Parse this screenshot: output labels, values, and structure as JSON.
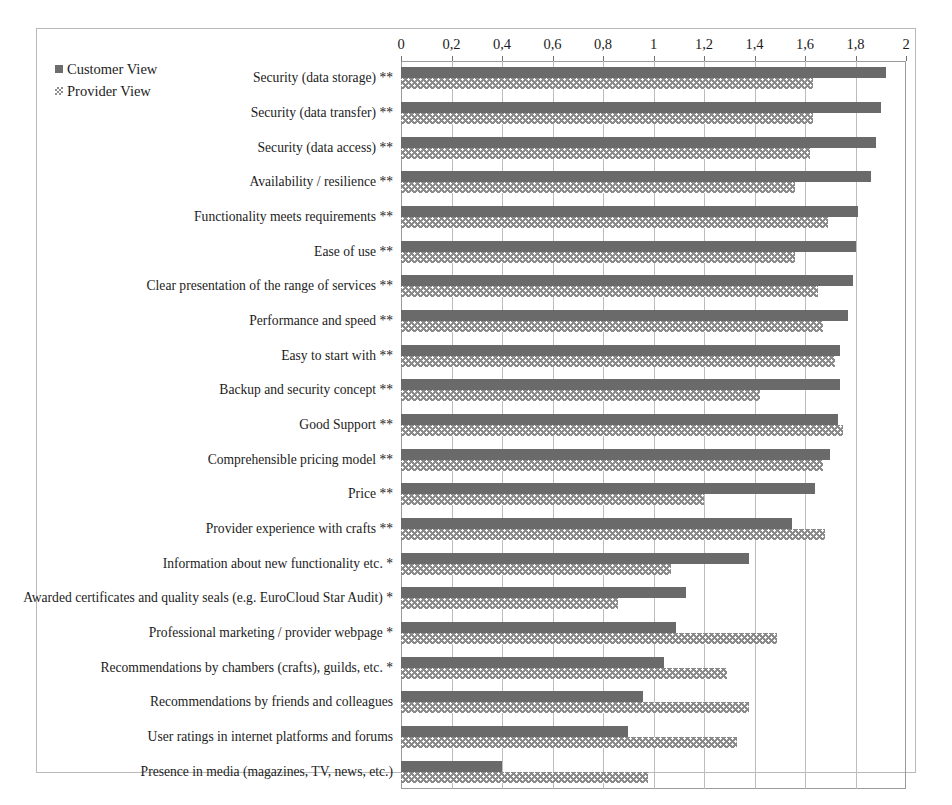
{
  "chart_data": {
    "type": "bar",
    "orientation": "horizontal",
    "title": "",
    "xlabel": "",
    "ylabel": "",
    "xlim": [
      0,
      2
    ],
    "xticks": [
      0,
      0.2,
      0.4,
      0.6,
      0.8,
      1,
      1.2,
      1.4,
      1.6,
      1.8,
      2
    ],
    "xtick_labels": [
      "0",
      "0,2",
      "0,4",
      "0,6",
      "0,8",
      "1",
      "1,2",
      "1,4",
      "1,6",
      "1,8",
      "2"
    ],
    "decimal_separator": ",",
    "grid": true,
    "legend_position": "top-left",
    "legend": [
      "Customer View",
      "Provider View"
    ],
    "colors": {
      "customer": "#6a6a6a",
      "provider": "#8a8a8a",
      "grid": "#bcbcbc",
      "frame": "#9a9a9a"
    },
    "categories": [
      "Security (data storage) **",
      "Security (data transfer) **",
      "Security (data access) **",
      "Availability / resilience **",
      "Functionality meets requirements **",
      "Ease of use **",
      "Clear presentation of the range of services **",
      "Performance and speed **",
      "Easy to start with **",
      "Backup and security concept **",
      "Good Support **",
      "Comprehensible pricing model **",
      "Price **",
      "Provider experience with crafts **",
      "Information about new functionality etc. *",
      "Awarded certificates and quality seals (e.g. EuroCloud Star Audit) *",
      "Professional marketing / provider webpage *",
      "Recommendations by chambers (crafts), guilds, etc. *",
      "Recommendations by friends and colleagues",
      "User ratings in internet platforms and forums",
      "Presence in media (magazines, TV, news, etc.)"
    ],
    "series": [
      {
        "name": "Customer View",
        "values": [
          1.92,
          1.9,
          1.88,
          1.86,
          1.81,
          1.8,
          1.79,
          1.77,
          1.74,
          1.74,
          1.73,
          1.7,
          1.64,
          1.55,
          1.38,
          1.13,
          1.09,
          1.04,
          0.96,
          0.9,
          0.4
        ]
      },
      {
        "name": "Provider View",
        "values": [
          1.63,
          1.63,
          1.62,
          1.56,
          1.69,
          1.56,
          1.65,
          1.67,
          1.72,
          1.42,
          1.75,
          1.67,
          1.2,
          1.68,
          1.07,
          0.86,
          1.49,
          1.29,
          1.38,
          1.33,
          0.98
        ]
      }
    ]
  },
  "legend": {
    "items": [
      {
        "label": "Customer View",
        "key": "customer"
      },
      {
        "label": "Provider View",
        "key": "provider"
      }
    ]
  }
}
